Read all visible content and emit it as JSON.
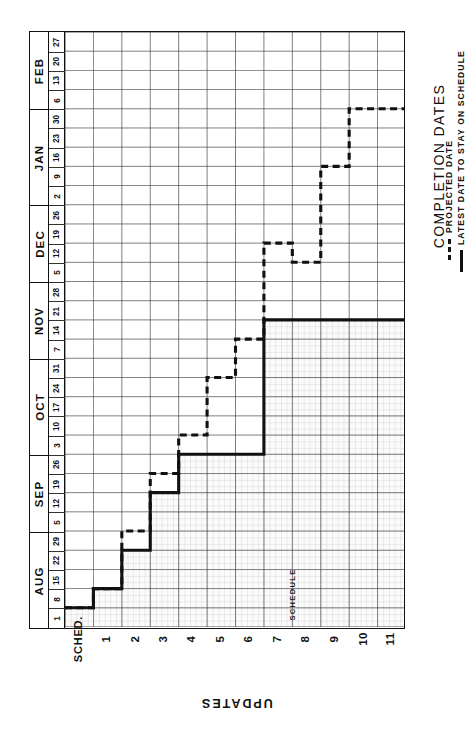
{
  "chart_data": {
    "type": "line",
    "title": "COMPLETION DATES",
    "xlabel": "UPDATES",
    "ylabel": "COMPLETION DATES",
    "annotation": "SCHEDULE",
    "grid": true,
    "legend_position": "right",
    "x_categories": [
      "SCHED.",
      "1",
      "2",
      "3",
      "4",
      "5",
      "6",
      "7",
      "8",
      "9",
      "10",
      "11"
    ],
    "y_months": [
      {
        "name": "AUG",
        "weeks": [
          "1",
          "8",
          "15",
          "22",
          "29"
        ]
      },
      {
        "name": "SEP",
        "weeks": [
          "5",
          "12",
          "19",
          "26"
        ]
      },
      {
        "name": "OCT",
        "weeks": [
          "3",
          "10",
          "17",
          "24",
          "31"
        ]
      },
      {
        "name": "NOV",
        "weeks": [
          "7",
          "14",
          "21",
          "28"
        ]
      },
      {
        "name": "DEC",
        "weeks": [
          "5",
          "12",
          "19",
          "26"
        ]
      },
      {
        "name": "JAN",
        "weeks": [
          "2",
          "9",
          "16",
          "23",
          "30"
        ]
      },
      {
        "name": "FEB",
        "weeks": [
          "6",
          "13",
          "20",
          "27"
        ]
      }
    ],
    "y_tick_labels_bottom_to_top": [
      "1",
      "8",
      "15",
      "22",
      "29",
      "5",
      "12",
      "19",
      "26",
      "3",
      "10",
      "17",
      "24",
      "31",
      "7",
      "14",
      "21",
      "28",
      "5",
      "12",
      "19",
      "26",
      "2",
      "9",
      "16",
      "23",
      "30",
      "6",
      "13",
      "20",
      "27"
    ],
    "series": [
      {
        "name": "LATEST DATE TO STAY ON SCHEDULE",
        "style": "solid",
        "color": "#111111",
        "step": "post",
        "points": [
          {
            "x": "SCHED.",
            "y_week_index": 0,
            "y_label": "AUG 1"
          },
          {
            "x": "1",
            "y_week_index": 1,
            "y_label": "AUG 8"
          },
          {
            "x": "2",
            "y_week_index": 3,
            "y_label": "AUG 22"
          },
          {
            "x": "3",
            "y_week_index": 6,
            "y_label": "SEP 12"
          },
          {
            "x": "4",
            "y_week_index": 8,
            "y_label": "SEP 26"
          },
          {
            "x": "5",
            "y_week_index": 8,
            "y_label": "SEP 26"
          },
          {
            "x": "6",
            "y_week_index": 8,
            "y_label": "SEP 26"
          },
          {
            "x": "7",
            "y_week_index": 15,
            "y_label": "NOV 14"
          },
          {
            "x": "8",
            "y_week_index": 15,
            "y_label": "NOV 14"
          },
          {
            "x": "9",
            "y_week_index": 15,
            "y_label": "NOV 14"
          },
          {
            "x": "10",
            "y_week_index": 15,
            "y_label": "NOV 14"
          },
          {
            "x": "11",
            "y_week_index": 15,
            "y_label": "NOV 14"
          }
        ]
      },
      {
        "name": "PROJECTED DATE",
        "style": "dashed",
        "color": "#111111",
        "step": "post",
        "points": [
          {
            "x": "SCHED.",
            "y_week_index": 0,
            "y_label": "AUG 1"
          },
          {
            "x": "1",
            "y_week_index": 1,
            "y_label": "AUG 8"
          },
          {
            "x": "2",
            "y_week_index": 4,
            "y_label": "AUG 29"
          },
          {
            "x": "3",
            "y_week_index": 7,
            "y_label": "SEP 19"
          },
          {
            "x": "4",
            "y_week_index": 9,
            "y_label": "OCT 3"
          },
          {
            "x": "5",
            "y_week_index": 12,
            "y_label": "OCT 24"
          },
          {
            "x": "6",
            "y_week_index": 14,
            "y_label": "NOV 7"
          },
          {
            "x": "7",
            "y_week_index": 19,
            "y_label": "DEC 12"
          },
          {
            "x": "8",
            "y_week_index": 18,
            "y_label": "DEC 5"
          },
          {
            "x": "9",
            "y_week_index": 23,
            "y_label": "JAN 9"
          },
          {
            "x": "10",
            "y_week_index": 26,
            "y_label": "JAN 30"
          },
          {
            "x": "11",
            "y_week_index": 26,
            "y_label": "JAN 30"
          }
        ]
      }
    ],
    "shaded_region": {
      "label": "SCHEDULE",
      "description": "fine-hatched area under the latest-date-to-stay-on-schedule step line"
    }
  },
  "legend": {
    "title": "COMPLETION DATES",
    "items": [
      {
        "label": "LATEST DATE TO STAY ON  SCHEDULE",
        "style": "solid"
      },
      {
        "label": "PROJECTED DATE",
        "style": "dashed"
      }
    ]
  },
  "axis": {
    "x_title": "UPDATES",
    "x_labels": [
      "SCHED.",
      "1",
      "2",
      "3",
      "4",
      "5",
      "6",
      "7",
      "8",
      "9",
      "10",
      "11"
    ]
  },
  "colors": {
    "ink": "#111111",
    "grid_major": "#3a3a3a",
    "grid_minor": "#9a9a9a",
    "shade": "#efefef",
    "paper": "#ffffff"
  }
}
